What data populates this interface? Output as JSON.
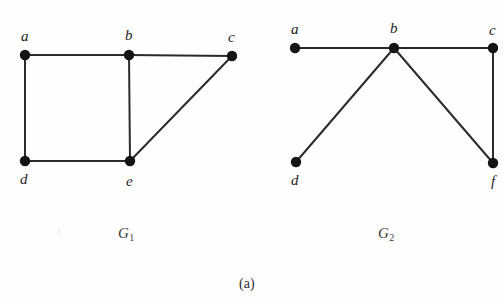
{
  "figure": {
    "caption": "(a)",
    "caption_pos": {
      "x": 239,
      "y": 277
    },
    "background": "#fefefe",
    "edge_color": "#2b2b2b",
    "vertex_color": "#141414",
    "label_color": "#1c1c1c"
  },
  "graphs": [
    {
      "id": "G1",
      "name": "G",
      "subscript": "1",
      "name_pos": {
        "x": 118,
        "y": 226
      },
      "vertices": [
        {
          "id": "a",
          "label": "a",
          "x": 25,
          "y": 55,
          "label_x": 21,
          "label_y": 29
        },
        {
          "id": "b",
          "label": "b",
          "x": 129,
          "y": 55,
          "label_x": 125,
          "label_y": 28
        },
        {
          "id": "c",
          "label": "c",
          "x": 232,
          "y": 56,
          "label_x": 228,
          "label_y": 30
        },
        {
          "id": "d",
          "label": "d",
          "x": 25,
          "y": 161,
          "label_x": 20,
          "label_y": 172
        },
        {
          "id": "e",
          "label": "e",
          "x": 130,
          "y": 161,
          "label_x": 126,
          "label_y": 174
        }
      ],
      "edges": [
        {
          "from": "a",
          "to": "b"
        },
        {
          "from": "b",
          "to": "c"
        },
        {
          "from": "a",
          "to": "d"
        },
        {
          "from": "d",
          "to": "e"
        },
        {
          "from": "b",
          "to": "e"
        },
        {
          "from": "e",
          "to": "c"
        }
      ]
    },
    {
      "id": "G2",
      "name": "G",
      "subscript": "2",
      "name_pos": {
        "x": 378,
        "y": 226
      },
      "vertices": [
        {
          "id": "a",
          "label": "a",
          "x": 295,
          "y": 48,
          "label_x": 291,
          "label_y": 22
        },
        {
          "id": "b",
          "label": "b",
          "x": 394,
          "y": 48,
          "label_x": 390,
          "label_y": 21
        },
        {
          "id": "c",
          "label": "c",
          "x": 493,
          "y": 48,
          "label_x": 489,
          "label_y": 23
        },
        {
          "id": "d",
          "label": "d",
          "x": 296,
          "y": 162,
          "label_x": 291,
          "label_y": 173
        },
        {
          "id": "f",
          "label": "f",
          "x": 493,
          "y": 163,
          "label_x": 491,
          "label_y": 174
        }
      ],
      "edges": [
        {
          "from": "a",
          "to": "b"
        },
        {
          "from": "b",
          "to": "c"
        },
        {
          "from": "b",
          "to": "d"
        },
        {
          "from": "b",
          "to": "f"
        },
        {
          "from": "c",
          "to": "f"
        }
      ]
    }
  ],
  "geometry": {
    "vertex_radius": 5.2,
    "edge_width": 2.0
  }
}
